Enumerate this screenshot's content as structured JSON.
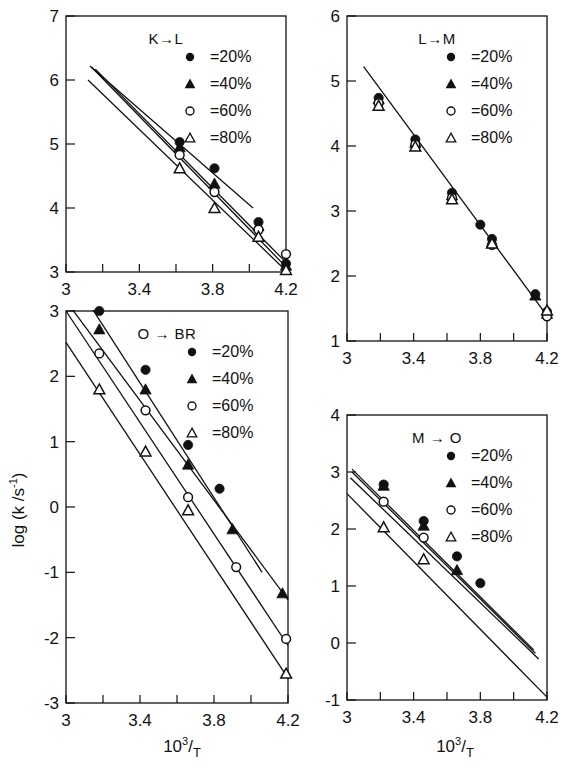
{
  "figure": {
    "axis_label_x": "10³/T",
    "axis_label_x_base": "10",
    "axis_label_x_sup": "3",
    "axis_label_x_den": "T",
    "axis_label_y": "log (k /s⁻¹)",
    "axis_label_y_main": "log (k /s",
    "axis_label_y_sup": "-1",
    "axis_label_y_end": ")",
    "series_colors": {
      "ink": "#111111",
      "paper": "#ffffff"
    },
    "legend": [
      {
        "marker": "filled-circle",
        "label": "=20%"
      },
      {
        "marker": "filled-triangle",
        "label": "=40%"
      },
      {
        "marker": "open-circle",
        "label": "=60%"
      },
      {
        "marker": "open-triangle",
        "label": "=80%"
      }
    ]
  },
  "chart_data": [
    {
      "id": "k-to-l",
      "type": "scatter",
      "title": "K→L",
      "xlabel": "10³/T",
      "ylabel": "log (k /s⁻¹)",
      "xlim": [
        3.0,
        4.2
      ],
      "ylim": [
        3,
        7
      ],
      "xticks": [
        3.0,
        3.2,
        3.4,
        3.6,
        3.8,
        4.0,
        4.2
      ],
      "xticklabels": [
        "3",
        "",
        "3.4",
        "",
        "3.8",
        "",
        "4.2"
      ],
      "yticks": [
        3,
        4,
        5,
        6,
        7
      ],
      "yticklabels": [
        "3",
        "4",
        "5",
        "6",
        "7"
      ],
      "grid": false,
      "legend_position": "top-right",
      "series": [
        {
          "name": "=20%",
          "marker": "filled-circle",
          "x": [
            3.62,
            3.81,
            4.05,
            4.2
          ],
          "y": [
            5.03,
            4.62,
            3.78,
            3.13
          ],
          "fit_line": {
            "x": [
              3.13,
              4.02
            ],
            "y": [
              6.22,
              4.0
            ]
          }
        },
        {
          "name": "=40%",
          "marker": "filled-triangle",
          "x": [
            3.62,
            3.81,
            4.05,
            4.2
          ],
          "y": [
            4.95,
            4.38,
            3.72,
            3.1
          ],
          "fit_line": {
            "x": [
              3.14,
              4.2
            ],
            "y": [
              6.2,
              3.08
            ]
          }
        },
        {
          "name": "=60%",
          "marker": "open-circle",
          "x": [
            3.62,
            3.81,
            4.05,
            4.2
          ],
          "y": [
            4.83,
            4.25,
            3.66,
            3.28
          ],
          "fit_line": {
            "x": [
              3.16,
              4.2
            ],
            "y": [
              6.17,
              3.15
            ]
          }
        },
        {
          "name": "=80%",
          "marker": "open-triangle",
          "x": [
            3.62,
            3.81,
            4.05,
            4.2
          ],
          "y": [
            4.62,
            4.0,
            3.55,
            3.03
          ],
          "fit_line": {
            "x": [
              3.12,
              4.2
            ],
            "y": [
              6.0,
              3.02
            ]
          }
        }
      ]
    },
    {
      "id": "l-to-m",
      "type": "scatter",
      "title": "L→M",
      "xlabel": "10³/T",
      "ylabel": "log (k /s⁻¹)",
      "xlim": [
        3.0,
        4.2
      ],
      "ylim": [
        1,
        6
      ],
      "xticks": [
        3.0,
        3.2,
        3.4,
        3.6,
        3.8,
        4.0,
        4.2
      ],
      "xticklabels": [
        "3",
        "",
        "3.4",
        "",
        "3.8",
        "",
        "4.2"
      ],
      "yticks": [
        1,
        2,
        3,
        4,
        5,
        6
      ],
      "yticklabels": [
        "1",
        "2",
        "3",
        "4",
        "5",
        "6"
      ],
      "grid": false,
      "legend_position": "top-right",
      "series": [
        {
          "name": "=20%",
          "marker": "filled-circle",
          "x": [
            3.19,
            3.41,
            3.63,
            3.8,
            3.87,
            4.13,
            4.2
          ],
          "y": [
            4.74,
            4.1,
            3.28,
            2.79,
            2.57,
            1.72,
            1.45
          ]
        },
        {
          "name": "=40%",
          "marker": "filled-triangle",
          "x": [
            3.19,
            3.41,
            3.63,
            3.87,
            4.13,
            4.2
          ],
          "y": [
            4.72,
            4.05,
            3.24,
            2.52,
            1.7,
            1.42
          ]
        },
        {
          "name": "=60%",
          "marker": "open-circle",
          "x": [
            3.19,
            3.41,
            3.63,
            3.87,
            4.2
          ],
          "y": [
            4.66,
            4.02,
            3.2,
            2.48,
            1.38
          ]
        },
        {
          "name": "=80%",
          "marker": "open-triangle",
          "x": [
            3.19,
            3.41,
            3.63,
            3.87,
            4.2
          ],
          "y": [
            4.62,
            3.99,
            3.18,
            2.5,
            1.47
          ]
        }
      ],
      "fit_line": {
        "x": [
          3.1,
          4.22
        ],
        "y": [
          5.22,
          1.32
        ]
      }
    },
    {
      "id": "o-to-br",
      "type": "scatter",
      "title": "O → BR",
      "xlabel": "10³/T",
      "ylabel": "log (k /s⁻¹)",
      "xlim": [
        3.0,
        4.2
      ],
      "ylim": [
        -3,
        3
      ],
      "xticks": [
        3.0,
        3.2,
        3.4,
        3.6,
        3.8,
        4.0,
        4.2
      ],
      "xticklabels": [
        "3",
        "",
        "3.4",
        "",
        "3.8",
        "",
        "4.2"
      ],
      "yticks": [
        -3,
        -2,
        -1,
        0,
        1,
        2,
        3
      ],
      "yticklabels": [
        "-3",
        "-2",
        "-1",
        "0",
        "1",
        "2",
        "3"
      ],
      "grid": false,
      "legend_position": "top-right",
      "series": [
        {
          "name": "=20%",
          "marker": "filled-circle",
          "x": [
            3.18,
            3.43,
            3.66,
            3.83
          ],
          "y": [
            3.0,
            2.1,
            0.95,
            0.28
          ],
          "fit_line": {
            "x": [
              3.07,
              4.06
            ],
            "y": [
              3.35,
              -1.0
            ]
          }
        },
        {
          "name": "=40%",
          "marker": "filled-triangle",
          "x": [
            3.18,
            3.43,
            3.66,
            3.9,
            4.17
          ],
          "y": [
            2.72,
            1.8,
            0.65,
            -0.34,
            -1.32
          ],
          "fit_line": {
            "x": [
              3.03,
              4.2
            ],
            "y": [
              3.04,
              -1.42
            ]
          }
        },
        {
          "name": "=60%",
          "marker": "open-circle",
          "x": [
            3.18,
            3.43,
            3.66,
            3.92,
            4.19
          ],
          "y": [
            2.35,
            1.48,
            0.15,
            -0.92,
            -2.02
          ],
          "fit_line": {
            "x": [
              3.0,
              4.2
            ],
            "y": [
              3.0,
              -2.12
            ]
          }
        },
        {
          "name": "=80%",
          "marker": "open-triangle",
          "x": [
            3.18,
            3.43,
            3.66,
            4.19
          ],
          "y": [
            1.8,
            0.85,
            -0.05,
            -2.55
          ],
          "fit_line": {
            "x": [
              3.0,
              4.2
            ],
            "y": [
              2.52,
              -2.62
            ]
          }
        }
      ]
    },
    {
      "id": "m-to-o",
      "type": "scatter",
      "title": "M → O",
      "xlabel": "10³/T",
      "ylabel": "log (k /s⁻¹)",
      "xlim": [
        3.0,
        4.2
      ],
      "ylim": [
        -1,
        4
      ],
      "xticks": [
        3.0,
        3.2,
        3.4,
        3.6,
        3.8,
        4.0,
        4.2
      ],
      "xticklabels": [
        "3",
        "",
        "3.4",
        "",
        "3.8",
        "",
        "4.2"
      ],
      "yticks": [
        -1,
        0,
        1,
        2,
        3,
        4
      ],
      "yticklabels": [
        "-1",
        "0",
        "1",
        "2",
        "3",
        "4"
      ],
      "grid": false,
      "legend_position": "top-right",
      "series": [
        {
          "name": "=20%",
          "marker": "filled-circle",
          "x": [
            3.22,
            3.46,
            3.66,
            3.8
          ],
          "y": [
            2.78,
            2.14,
            1.52,
            1.05
          ],
          "fit_line": {
            "x": [
              3.03,
              4.12
            ],
            "y": [
              3.05,
              -0.12
            ]
          }
        },
        {
          "name": "=40%",
          "marker": "filled-triangle",
          "x": [
            3.22,
            3.46,
            3.66
          ],
          "y": [
            2.76,
            2.06,
            1.28
          ],
          "fit_line": {
            "x": [
              3.03,
              4.13
            ],
            "y": [
              3.0,
              -0.18
            ]
          }
        },
        {
          "name": "=60%",
          "marker": "open-circle",
          "x": [
            3.22,
            3.46
          ],
          "y": [
            2.48,
            1.85
          ],
          "fit_line": {
            "x": [
              3.02,
              4.15
            ],
            "y": [
              2.9,
              -0.28
            ]
          }
        },
        {
          "name": "=80%",
          "marker": "open-triangle",
          "x": [
            3.22,
            3.46
          ],
          "y": [
            2.03,
            1.47
          ],
          "fit_line": {
            "x": [
              3.0,
              4.2
            ],
            "y": [
              2.62,
              -0.95
            ]
          }
        }
      ]
    }
  ]
}
